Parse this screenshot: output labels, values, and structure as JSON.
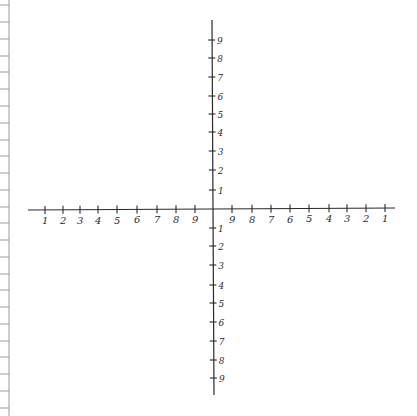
{
  "diagram": {
    "type": "hand-drawn coordinate plane on notebook paper",
    "colors": {
      "ink": "#2a2a2a",
      "margin_line": "#9a9a9a",
      "paper": "#ffffff"
    },
    "origin": {
      "x": 212,
      "y": 210
    },
    "x_axis": {
      "left_end": 28,
      "right_end": 395,
      "left_ticks": [
        {
          "x": 45,
          "label": "1"
        },
        {
          "x": 63,
          "label": "2"
        },
        {
          "x": 80,
          "label": "3"
        },
        {
          "x": 98,
          "label": "4"
        },
        {
          "x": 117,
          "label": "5"
        },
        {
          "x": 137,
          "label": "6"
        },
        {
          "x": 157,
          "label": "7"
        },
        {
          "x": 176,
          "label": "8"
        },
        {
          "x": 195,
          "label": "9"
        }
      ],
      "right_ticks": [
        {
          "x": 232,
          "label": "9"
        },
        {
          "x": 252,
          "label": "8"
        },
        {
          "x": 271,
          "label": "7"
        },
        {
          "x": 290,
          "label": "6"
        },
        {
          "x": 309,
          "label": "5"
        },
        {
          "x": 329,
          "label": "4"
        },
        {
          "x": 347,
          "label": "3"
        },
        {
          "x": 366,
          "label": "2"
        },
        {
          "x": 385,
          "label": "1"
        }
      ]
    },
    "y_axis": {
      "top_end": 20,
      "bottom_end": 395,
      "upper_ticks": [
        {
          "y": 40,
          "label": "9"
        },
        {
          "y": 58,
          "label": "8"
        },
        {
          "y": 77,
          "label": "7"
        },
        {
          "y": 96,
          "label": "6"
        },
        {
          "y": 114,
          "label": "5"
        },
        {
          "y": 132,
          "label": "4"
        },
        {
          "y": 151,
          "label": "3"
        },
        {
          "y": 170,
          "label": "2"
        },
        {
          "y": 190,
          "label": "1"
        }
      ],
      "lower_ticks": [
        {
          "y": 228,
          "label": "1"
        },
        {
          "y": 246,
          "label": "2"
        },
        {
          "y": 265,
          "label": "3"
        },
        {
          "y": 285,
          "label": "4"
        },
        {
          "y": 303,
          "label": "5"
        },
        {
          "y": 322,
          "label": "6"
        },
        {
          "y": 341,
          "label": "7"
        },
        {
          "y": 360,
          "label": "8"
        },
        {
          "y": 378,
          "label": "9"
        }
      ]
    },
    "margin": {
      "x": 9,
      "ruled_line_ys": [
        5,
        22,
        39,
        56,
        72,
        89,
        106,
        123,
        140,
        156,
        173,
        190,
        207,
        223,
        240,
        257,
        274,
        290,
        307,
        324,
        341,
        357,
        374,
        391,
        408
      ]
    }
  }
}
